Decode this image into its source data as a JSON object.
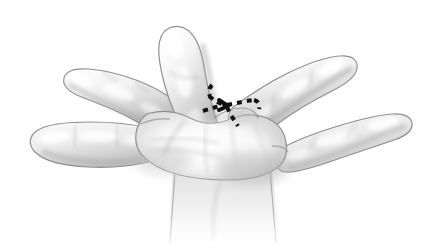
{
  "figure": {
    "domain": "medical-anatomical-illustration",
    "title": "Hand with surgical incision marking",
    "background_color": "#ffffff",
    "ink_color": "#6c6c6c",
    "skin_light": "#ffffff",
    "skin_mid": "#d8d8d8",
    "skin_shadow": "#9a9a9a",
    "marking_color": "#111111",
    "visible_text": [],
    "labels": [],
    "parts": [
      {
        "name": "thumb",
        "position": "upper-center",
        "tip_xy": [
          175,
          30
        ]
      },
      {
        "name": "index-finger",
        "position": "left-upper",
        "tip_xy": [
          68,
          78
        ]
      },
      {
        "name": "middle-finger",
        "position": "right-upper",
        "tip_xy": [
          352,
          62
        ]
      },
      {
        "name": "ring-finger",
        "position": "left-lower",
        "tip_xy": [
          33,
          135
        ]
      },
      {
        "name": "little-finger",
        "position": "right-lower",
        "tip_xy": [
          400,
          122
        ]
      },
      {
        "name": "palm",
        "position": "center",
        "tip_xy": [
          210,
          150
        ]
      },
      {
        "name": "wrist",
        "position": "bottom-center",
        "tip_xy": [
          222,
          230
        ]
      }
    ],
    "marking": {
      "name": "dashed-incision-line",
      "style": "dashed",
      "shape": "branched Z-plasty / Y-V flap design",
      "location": "first web space, radial side",
      "stroke_width": 4,
      "dash_pattern": "5 5"
    }
  }
}
